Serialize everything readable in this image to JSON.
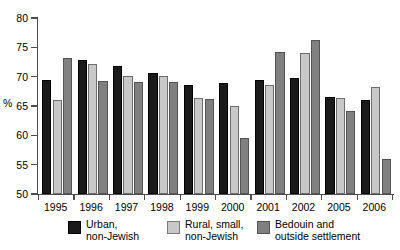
{
  "chart_data": {
    "type": "bar",
    "title": "",
    "subtitle": "",
    "xlabel": "",
    "ylabel": "%",
    "ylim": [
      50,
      80
    ],
    "ytick_step": 5,
    "yticks": [
      50,
      55,
      60,
      65,
      70,
      75,
      80
    ],
    "grid": false,
    "legend_position": "bottom",
    "categories": [
      "1995",
      "1996",
      "1997",
      "1998",
      "1999",
      "2000",
      "2001",
      "2002",
      "2005",
      "2006"
    ],
    "series": [
      {
        "name": "Urban, non-Jewish",
        "color": "#1a1a1a",
        "values": [
          69.4,
          72.8,
          71.8,
          70.6,
          68.6,
          68.9,
          69.4,
          69.8,
          66.5,
          66.1
        ]
      },
      {
        "name": "Rural, small, non-Jewish",
        "color": "#c8c8c8",
        "values": [
          66.1,
          72.2,
          70.1,
          70.1,
          66.4,
          65.0,
          68.6,
          74.0,
          66.4,
          68.2
        ]
      },
      {
        "name": "Bedouin and outside settlement",
        "color": "#808080",
        "values": [
          73.1,
          69.3,
          69.1,
          69.1,
          66.2,
          59.5,
          74.2,
          76.2,
          64.2,
          56.0
        ]
      }
    ]
  },
  "legend": {
    "items": [
      {
        "line1": "Urban,",
        "line2": "non-Jewish",
        "swatch": "black-square-icon"
      },
      {
        "line1": "Rural, small,",
        "line2": "non-Jewish",
        "swatch": "light-gray-square-icon"
      },
      {
        "line1": "Bedouin and",
        "line2": "outside settlement",
        "swatch": "medium-gray-square-icon"
      }
    ]
  }
}
